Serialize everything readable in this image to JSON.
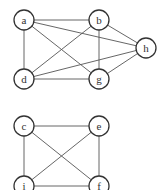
{
  "graphs": [
    {
      "nodes": [
        {
          "id": "a",
          "x": 24,
          "y": 20
        },
        {
          "id": "b",
          "x": 99,
          "y": 20
        },
        {
          "id": "h",
          "x": 146,
          "y": 48
        },
        {
          "id": "d",
          "x": 24,
          "y": 79
        },
        {
          "id": "g",
          "x": 99,
          "y": 79
        }
      ],
      "edges": [
        [
          "a",
          "b"
        ],
        [
          "a",
          "d"
        ],
        [
          "a",
          "h"
        ],
        [
          "a",
          "g"
        ],
        [
          "b",
          "d"
        ],
        [
          "b",
          "g"
        ],
        [
          "b",
          "h"
        ],
        [
          "d",
          "h"
        ],
        [
          "d",
          "g"
        ],
        [
          "g",
          "h"
        ]
      ]
    },
    {
      "nodes": [
        {
          "id": "c",
          "x": 24,
          "y": 126
        },
        {
          "id": "e",
          "x": 99,
          "y": 126
        },
        {
          "id": "i",
          "x": 24,
          "y": 186
        },
        {
          "id": "f",
          "x": 99,
          "y": 186
        }
      ],
      "edges": [
        [
          "c",
          "e"
        ],
        [
          "c",
          "i"
        ],
        [
          "c",
          "f"
        ],
        [
          "e",
          "i"
        ],
        [
          "e",
          "f"
        ],
        [
          "i",
          "f"
        ]
      ]
    }
  ]
}
